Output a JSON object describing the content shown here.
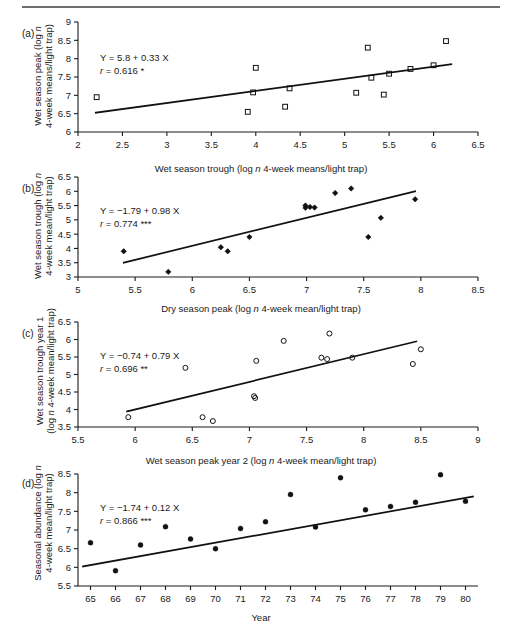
{
  "figure": {
    "panel_letters": [
      "(a)",
      "(b)",
      "(c)",
      "(d)"
    ]
  },
  "chart_data": [
    {
      "type": "scatter",
      "panel": "(a)",
      "title": "",
      "xlabel": "Wet season trough (log n 4-week means/light trap)",
      "ylabel": "Wet season peak (log n 4-week means/light trap)",
      "xlim": [
        2,
        6.5
      ],
      "ylim": [
        6,
        9
      ],
      "xticks": [
        "2",
        "2.5",
        "3",
        "3.5",
        "4",
        "4.5",
        "5",
        "5.5",
        "6",
        "6.5"
      ],
      "yticks": [
        "6",
        "6.5",
        "7",
        "7.5",
        "8",
        "8.5",
        "9"
      ],
      "grid": false,
      "legend": "none",
      "marker": "open-square",
      "equation": "Y = 5.8 + 0.33 X",
      "correlation": "r = 0.616 *",
      "fit": {
        "intercept": 5.8,
        "slope": 0.33,
        "x_start": 2.2,
        "x_end": 6.2
      },
      "points": [
        {
          "x": 2.21,
          "y": 6.95
        },
        {
          "x": 3.91,
          "y": 6.55
        },
        {
          "x": 3.97,
          "y": 7.08
        },
        {
          "x": 4.0,
          "y": 7.75
        },
        {
          "x": 4.33,
          "y": 6.69
        },
        {
          "x": 4.38,
          "y": 7.19
        },
        {
          "x": 5.13,
          "y": 7.07
        },
        {
          "x": 5.26,
          "y": 8.3
        },
        {
          "x": 5.3,
          "y": 7.48
        },
        {
          "x": 5.44,
          "y": 7.02
        },
        {
          "x": 5.5,
          "y": 7.59
        },
        {
          "x": 5.74,
          "y": 7.72
        },
        {
          "x": 6.0,
          "y": 7.82
        },
        {
          "x": 6.14,
          "y": 8.48
        }
      ]
    },
    {
      "type": "scatter",
      "panel": "(b)",
      "title": "",
      "xlabel": "Dry season peak (log n 4-week mean/light trap)",
      "ylabel": "Wet season trough (log n 4-week mean/light trap)",
      "xlim": [
        5,
        8.5
      ],
      "ylim": [
        3,
        6.5
      ],
      "xticks": [
        "5",
        "5.5",
        "6",
        "6.5",
        "7",
        "7.5",
        "8",
        "8.5"
      ],
      "yticks": [
        "3",
        "3.5",
        "4",
        "4.5",
        "5",
        "5.5",
        "6",
        "6.5"
      ],
      "grid": false,
      "legend": "none",
      "marker": "filled-diamond",
      "equation": "Y = −1.79 + 0.98 X",
      "correlation": "r = 0.774 ***",
      "fit": {
        "intercept": -1.79,
        "slope": 0.98,
        "x_start": 5.4,
        "x_end": 7.95
      },
      "points": [
        {
          "x": 5.4,
          "y": 3.9
        },
        {
          "x": 5.79,
          "y": 3.18
        },
        {
          "x": 6.25,
          "y": 4.04
        },
        {
          "x": 6.31,
          "y": 3.9
        },
        {
          "x": 6.5,
          "y": 4.4
        },
        {
          "x": 6.99,
          "y": 5.5
        },
        {
          "x": 6.99,
          "y": 5.42
        },
        {
          "x": 7.03,
          "y": 5.45
        },
        {
          "x": 7.07,
          "y": 5.43
        },
        {
          "x": 7.25,
          "y": 5.94
        },
        {
          "x": 7.39,
          "y": 6.1
        },
        {
          "x": 7.54,
          "y": 4.4
        },
        {
          "x": 7.65,
          "y": 5.07
        },
        {
          "x": 7.95,
          "y": 5.72
        }
      ]
    },
    {
      "type": "scatter",
      "panel": "(c)",
      "title": "",
      "xlabel": "Wet season peak year 2 (log n 4-week mean/light trap)",
      "ylabel": "Wet season trough year 1 (log n 4-week mean/light trap)",
      "xlim": [
        5.5,
        9
      ],
      "ylim": [
        3.5,
        6.5
      ],
      "xticks": [
        "5.5",
        "6",
        "6.5",
        "7",
        "7.5",
        "8",
        "8.5",
        "9"
      ],
      "yticks": [
        "3.5",
        "4",
        "4.5",
        "5",
        "5.5",
        "6",
        "6.5"
      ],
      "grid": false,
      "legend": "none",
      "marker": "open-circle",
      "equation": "Y = −0.74 + 0.79 X",
      "correlation": "r = 0.696 **",
      "fit": {
        "intercept": -0.74,
        "slope": 0.79,
        "x_start": 5.93,
        "x_end": 8.46
      },
      "points": [
        {
          "x": 5.94,
          "y": 3.78
        },
        {
          "x": 6.44,
          "y": 5.19
        },
        {
          "x": 6.59,
          "y": 3.78
        },
        {
          "x": 6.68,
          "y": 3.67
        },
        {
          "x": 7.04,
          "y": 4.38
        },
        {
          "x": 7.05,
          "y": 4.33
        },
        {
          "x": 7.06,
          "y": 5.39
        },
        {
          "x": 7.3,
          "y": 5.96
        },
        {
          "x": 7.63,
          "y": 5.48
        },
        {
          "x": 7.68,
          "y": 5.44
        },
        {
          "x": 7.7,
          "y": 6.17
        },
        {
          "x": 7.9,
          "y": 5.48
        },
        {
          "x": 8.43,
          "y": 5.3
        },
        {
          "x": 8.5,
          "y": 5.72
        }
      ]
    },
    {
      "type": "scatter",
      "panel": "(d)",
      "title": "",
      "xlabel": "Year",
      "ylabel": "Seasonal abundance (log n 4-week mean/light trap)",
      "xlim": [
        64.5,
        80.5
      ],
      "ylim": [
        5.5,
        8.5
      ],
      "xticks": [
        "65",
        "66",
        "67",
        "68",
        "69",
        "70",
        "71",
        "72",
        "73",
        "74",
        "75",
        "76",
        "77",
        "78",
        "79",
        "80"
      ],
      "yticks": [
        "5.5",
        "6",
        "6.5",
        "7",
        "7.5",
        "8",
        "8.5"
      ],
      "grid": false,
      "legend": "none",
      "marker": "filled-circle",
      "equation": "Y = −1.74 + 0.12 X",
      "correlation": "r = 0.866 ***",
      "fit": {
        "intercept": -1.74,
        "slope": 0.12,
        "x_start": 64.7,
        "x_end": 80.3
      },
      "points": [
        {
          "x": 65,
          "y": 6.66
        },
        {
          "x": 66,
          "y": 5.91
        },
        {
          "x": 67,
          "y": 6.6
        },
        {
          "x": 68,
          "y": 7.09
        },
        {
          "x": 69,
          "y": 6.76
        },
        {
          "x": 70,
          "y": 6.5
        },
        {
          "x": 71,
          "y": 7.04
        },
        {
          "x": 72,
          "y": 7.22
        },
        {
          "x": 73,
          "y": 7.95
        },
        {
          "x": 74,
          "y": 7.08
        },
        {
          "x": 75,
          "y": 8.4
        },
        {
          "x": 76,
          "y": 7.54
        },
        {
          "x": 77,
          "y": 7.63
        },
        {
          "x": 78,
          "y": 7.74
        },
        {
          "x": 79,
          "y": 8.48
        },
        {
          "x": 80,
          "y": 7.77
        }
      ]
    }
  ],
  "labels": {
    "a": {
      "letter": "(a)",
      "ylabel_line1": "Wet season peak (log n",
      "ylabel_line2": "4-week means/light trap)",
      "xlabel": "Wet season trough (log n 4-week means/light trap)",
      "eq": "Y = 5.8 + 0.33 X",
      "r": "r = 0.616 *"
    },
    "b": {
      "letter": "(b)",
      "ylabel_line1": "Wet season trough (log n",
      "ylabel_line2": "4-week mean/light trap)",
      "xlabel": "Dry season peak (log n 4-week mean/light trap)",
      "eq": "Y = −1.79 + 0.98 X",
      "r": "r = 0.774 ***"
    },
    "c": {
      "letter": "(c)",
      "ylabel_line1": "Wet season trough year 1",
      "ylabel_line2": "(log n 4-week mean/light trap)",
      "xlabel": "Wet season peak year 2 (log n 4-week mean/light trap)",
      "eq": "Y = −0.74 + 0.79 X",
      "r": "r = 0.696 **"
    },
    "d": {
      "letter": "(d)",
      "ylabel_line1": "Seasonal abundance (log n",
      "ylabel_line2": "4-week mean/light trap)",
      "xlabel": "Year",
      "eq": "Y = −1.74 + 0.12 X",
      "r": "r = 0.866 ***"
    }
  }
}
